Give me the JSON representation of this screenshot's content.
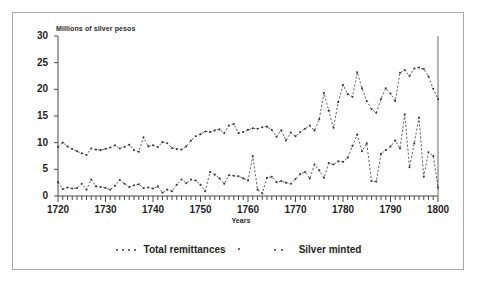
{
  "chart_data": {
    "type": "line",
    "title": "",
    "ylabel": "Millions of silver pesos",
    "xlabel": "Years",
    "xlim": [
      1720,
      1800
    ],
    "ylim": [
      0,
      30
    ],
    "yticks": [
      0,
      5,
      10,
      15,
      20,
      25,
      30
    ],
    "xticks": [
      1720,
      1730,
      1740,
      1750,
      1760,
      1770,
      1780,
      1790,
      1800
    ],
    "grid": false,
    "legend_position": "bottom",
    "marker": "dotted-line-with-points",
    "series_color": "#3a3a3a",
    "x": [
      1720,
      1721,
      1722,
      1723,
      1724,
      1725,
      1726,
      1727,
      1728,
      1729,
      1730,
      1731,
      1732,
      1733,
      1734,
      1735,
      1736,
      1737,
      1738,
      1739,
      1740,
      1741,
      1742,
      1743,
      1744,
      1745,
      1746,
      1747,
      1748,
      1749,
      1750,
      1751,
      1752,
      1753,
      1754,
      1755,
      1756,
      1757,
      1758,
      1759,
      1760,
      1761,
      1762,
      1763,
      1764,
      1765,
      1766,
      1767,
      1768,
      1769,
      1770,
      1771,
      1772,
      1773,
      1774,
      1775,
      1776,
      1777,
      1778,
      1779,
      1780,
      1781,
      1782,
      1783,
      1784,
      1785,
      1786,
      1787,
      1788,
      1789,
      1790,
      1791,
      1792,
      1793,
      1794,
      1795,
      1796,
      1797,
      1798,
      1799,
      1800
    ],
    "series": [
      {
        "name": "Total remittances",
        "values": [
          9.2,
          10.0,
          9.3,
          8.8,
          8.4,
          8.0,
          7.7,
          8.9,
          8.7,
          8.6,
          8.8,
          9.1,
          9.5,
          8.9,
          9.2,
          9.6,
          8.6,
          8.3,
          11.0,
          9.3,
          9.5,
          9.2,
          10.1,
          9.9,
          9.0,
          8.8,
          8.7,
          9.3,
          10.4,
          11.2,
          11.6,
          12.1,
          12.0,
          12.3,
          12.5,
          11.8,
          13.2,
          13.5,
          11.8,
          12.0,
          12.4,
          12.7,
          12.6,
          12.9,
          13.0,
          12.4,
          11.1,
          12.3,
          10.4,
          11.9,
          11.2,
          12.0,
          12.6,
          13.2,
          12.3,
          14.4,
          19.3,
          16.0,
          12.8,
          17.6,
          20.8,
          19.1,
          18.6,
          23.2,
          20.2,
          17.8,
          16.3,
          15.6,
          18.2,
          20.2,
          19.2,
          17.8,
          23.1,
          23.6,
          22.5,
          23.9,
          24.1,
          23.8,
          22.4,
          20.1,
          18.2
        ]
      },
      {
        "name": "Silver minted",
        "values": [
          2.6,
          1.3,
          1.6,
          1.4,
          1.5,
          2.3,
          1.2,
          3.1,
          1.8,
          1.7,
          1.5,
          1.2,
          1.9,
          3.0,
          2.3,
          1.7,
          2.0,
          2.2,
          1.5,
          1.6,
          1.4,
          1.8,
          0.6,
          1.2,
          0.9,
          2.1,
          3.1,
          2.4,
          3.1,
          2.9,
          2.1,
          0.9,
          4.5,
          4.0,
          3.3,
          2.3,
          3.9,
          3.8,
          3.7,
          3.3,
          2.9,
          7.5,
          1.2,
          0.5,
          3.4,
          3.6,
          2.6,
          2.8,
          2.5,
          2.3,
          3.2,
          4.1,
          4.5,
          3.3,
          5.9,
          4.8,
          3.4,
          6.2,
          5.9,
          6.5,
          6.4,
          7.2,
          9.4,
          11.5,
          8.4,
          9.9,
          2.8,
          2.7,
          7.9,
          8.6,
          9.3,
          10.4,
          8.9,
          15.3,
          5.4,
          9.9,
          14.7,
          3.6,
          8.2,
          7.5,
          1.6
        ]
      }
    ]
  },
  "labels": {
    "ylabel": "Millions of silver pesos",
    "xlabel": "Years",
    "legend": [
      "Total remittances",
      "Silver minted"
    ],
    "yticks": [
      "0",
      "5",
      "10",
      "15",
      "20",
      "25",
      "30"
    ],
    "xticks": [
      "1720",
      "1730",
      "1740",
      "1750",
      "1760",
      "1770",
      "1780",
      "1790",
      "1800"
    ]
  }
}
